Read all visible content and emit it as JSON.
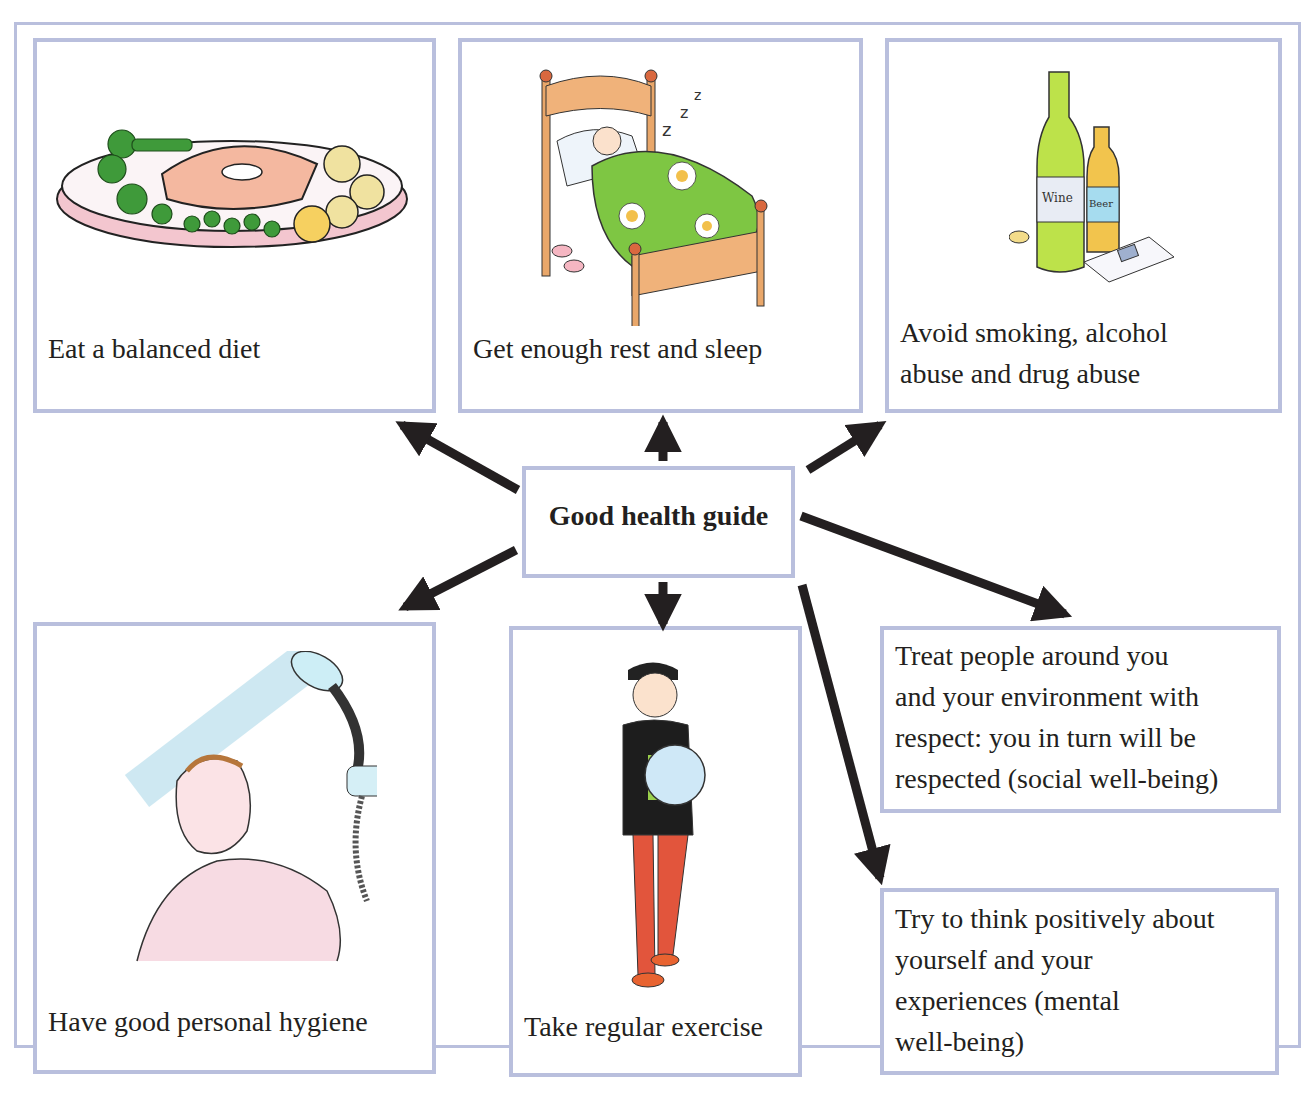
{
  "diagram": {
    "title": "Good health guide",
    "colors": {
      "border": "#b9bfdd",
      "arrow": "#231f20",
      "text": "#231f20"
    },
    "nodes": [
      {
        "id": "diet",
        "label": "Eat a balanced diet",
        "illustration": "plate-of-salmon-and-vegetables"
      },
      {
        "id": "sleep",
        "label": "Get enough rest and sleep",
        "illustration": "child-sleeping-in-bed"
      },
      {
        "id": "avoid",
        "label": "Avoid smoking, alcohol\nabuse and drug abuse",
        "illustration": "wine-beer-bottles-and-cigarettes"
      },
      {
        "id": "hygiene",
        "label": "Have good personal hygiene",
        "illustration": "person-under-shower"
      },
      {
        "id": "exercise",
        "label": "Take regular exercise",
        "illustration": "boy-holding-football"
      },
      {
        "id": "social",
        "label": "Treat people around you\nand your environment with\nrespect: you in turn will be\nrespected (social well-being)"
      },
      {
        "id": "mental",
        "label": "Try to think positively about\nyourself and your\nexperiences (mental\nwell-being)"
      }
    ],
    "edges": [
      {
        "from": "center",
        "to": "diet"
      },
      {
        "from": "center",
        "to": "sleep"
      },
      {
        "from": "center",
        "to": "avoid"
      },
      {
        "from": "center",
        "to": "hygiene"
      },
      {
        "from": "center",
        "to": "exercise"
      },
      {
        "from": "center",
        "to": "social"
      },
      {
        "from": "center",
        "to": "mental"
      }
    ]
  }
}
